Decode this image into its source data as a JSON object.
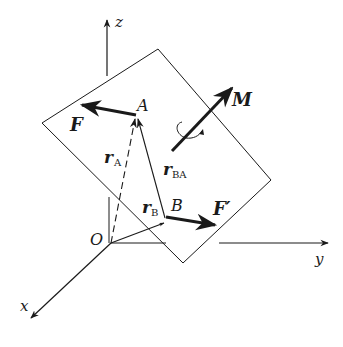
{
  "figure": {
    "axes": {
      "x_label": "x",
      "y_label": "y",
      "z_label": "z",
      "origin_label": "O"
    },
    "points": {
      "A": "A",
      "B": "B"
    },
    "vectors": {
      "F": "F",
      "F_prime": "F′",
      "M": "M",
      "r_A_main": "r",
      "r_A_sub": "A",
      "r_B_main": "r",
      "r_B_sub": "B",
      "r_BA_main": "r",
      "r_BA_sub": "BA"
    },
    "colors": {
      "line": "#1a1a1a",
      "background": "#ffffff"
    }
  }
}
